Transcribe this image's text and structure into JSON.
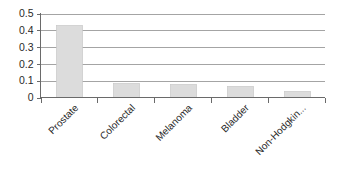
{
  "chart_data": {
    "type": "bar",
    "title": "",
    "subtitle": "",
    "xlabel": "",
    "ylabel": "",
    "categories": [
      "Prostate",
      "Colorectal",
      "Melanoma",
      "Bladder",
      "Non-Hodgkin..."
    ],
    "values": [
      0.43,
      0.085,
      0.078,
      0.068,
      0.038
    ],
    "ylim": [
      0,
      0.5
    ],
    "ytick_values": [
      0,
      0.1,
      0.2,
      0.3,
      0.4,
      0.5
    ],
    "ytick_labels": [
      "0",
      "0.1",
      "0.2",
      "0.3",
      "0.4",
      "0.5"
    ],
    "grid": true,
    "grid_axis": "y",
    "legend": false,
    "legend_position": "none",
    "series": [
      {
        "name": "",
        "values": [
          0.43,
          0.085,
          0.078,
          0.068,
          0.038
        ]
      }
    ],
    "colors": {
      "bar_fill": "#dcdcdc",
      "bar_border": "#c8c8c8",
      "gridline": "#9a9a9a",
      "axis": "#6a6a6a",
      "text": "#2a2a2a",
      "background": "#ffffff"
    },
    "xtick_label_rotation": -45
  }
}
